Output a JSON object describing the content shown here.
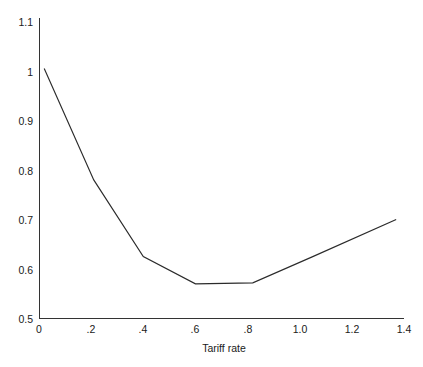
{
  "chart_data": {
    "type": "line",
    "title": "",
    "subtitle": "",
    "xlabel": "Tariff rate",
    "ylabel": "",
    "xlim": [
      0,
      1.4
    ],
    "ylim": [
      0.5,
      1.1
    ],
    "grid": false,
    "legend": null,
    "x_ticks": [
      "0",
      ".2",
      ".4",
      ".6",
      ".8",
      "1.0",
      "1.2",
      "1.4"
    ],
    "x_tick_values": [
      0,
      0.2,
      0.4,
      0.6,
      0.8,
      1.0,
      1.2,
      1.4
    ],
    "y_ticks": [
      "0.5",
      "0.6",
      "0.7",
      "0.8",
      "0.9",
      "1",
      "1.1"
    ],
    "y_tick_values": [
      0.5,
      0.6,
      0.7,
      0.8,
      0.9,
      1.0,
      1.1
    ],
    "series": [
      {
        "name": "welfare",
        "color": "#2b2b2b",
        "x": [
          0.02,
          0.21,
          0.4,
          0.6,
          0.82,
          1.05,
          1.37
        ],
        "values": [
          1.005,
          0.78,
          0.625,
          0.57,
          0.572,
          0.625,
          0.7
        ]
      }
    ]
  },
  "figure": {
    "background_color": "#ffffff",
    "axis_color": "#333333",
    "line_color": "#2b2b2b"
  }
}
